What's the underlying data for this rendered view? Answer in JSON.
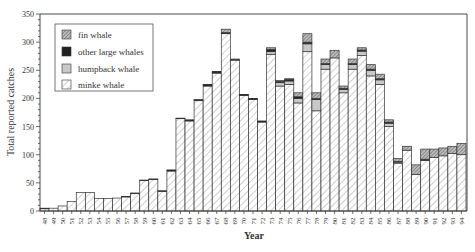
{
  "chart_data": {
    "type": "bar",
    "stacked": true,
    "title": "",
    "xlabel": "Year",
    "ylabel": "Total reported catches",
    "ylim": [
      0,
      350
    ],
    "yticks": [
      0,
      50,
      100,
      150,
      200,
      250,
      300,
      350
    ],
    "grid": false,
    "legend_position": "upper-left",
    "legend": [
      "fin whale",
      "other large whales",
      "humpback whale",
      "minke whale"
    ],
    "categories": [
      "48",
      "49",
      "50",
      "51",
      "52",
      "53",
      "54",
      "55",
      "56",
      "57",
      "58",
      "59",
      "60",
      "61",
      "62",
      "63",
      "64",
      "65",
      "66",
      "67",
      "68",
      "69",
      "70",
      "71",
      "72",
      "73",
      "74",
      "75",
      "76",
      "77",
      "78",
      "79",
      "80",
      "81",
      "82",
      "83",
      "84",
      "85",
      "86",
      "87",
      "88",
      "89",
      "90",
      "91",
      "92",
      "93",
      "94"
    ],
    "series": [
      {
        "name": "minke whale",
        "color": "#ffffff",
        "pattern": "light-hatch",
        "values": [
          4,
          5,
          9,
          17,
          33,
          33,
          22,
          22,
          23,
          25,
          31,
          54,
          56,
          35,
          71,
          164,
          160,
          196,
          222,
          245,
          315,
          268,
          205,
          198,
          158,
          278,
          222,
          225,
          192,
          283,
          178,
          252,
          272,
          210,
          252,
          276,
          240,
          225,
          150,
          85,
          108,
          65,
          90,
          95,
          98,
          102,
          100
        ]
      },
      {
        "name": "humpback whale",
        "color": "#c8c8c8",
        "pattern": "solid-gray",
        "values": [
          0,
          0,
          0,
          0,
          0,
          0,
          0,
          0,
          0,
          0,
          0,
          0,
          0,
          0,
          0,
          0,
          0,
          0,
          0,
          0,
          0,
          0,
          0,
          0,
          0,
          5,
          6,
          6,
          8,
          14,
          20,
          8,
          0,
          6,
          8,
          8,
          10,
          8,
          6,
          2,
          0,
          0,
          0,
          0,
          0,
          0,
          0
        ]
      },
      {
        "name": "other large whales",
        "color": "#222222",
        "pattern": "solid-black",
        "values": [
          1,
          0,
          0,
          0,
          0,
          0,
          0,
          0,
          0,
          1,
          1,
          1,
          1,
          1,
          2,
          1,
          2,
          2,
          2,
          2,
          2,
          1,
          1,
          1,
          2,
          4,
          2,
          3,
          3,
          3,
          2,
          2,
          0,
          2,
          2,
          2,
          2,
          2,
          2,
          1,
          0,
          0,
          2,
          0,
          0,
          0,
          0
        ]
      },
      {
        "name": "fin whale",
        "color": "#aaaaaa",
        "pattern": "dense-hatch",
        "values": [
          0,
          0,
          0,
          0,
          0,
          0,
          0,
          0,
          0,
          0,
          0,
          0,
          0,
          0,
          0,
          0,
          0,
          0,
          1,
          1,
          6,
          1,
          1,
          1,
          0,
          3,
          2,
          1,
          7,
          15,
          10,
          8,
          13,
          4,
          8,
          4,
          8,
          8,
          4,
          5,
          7,
          17,
          18,
          15,
          14,
          13,
          20
        ]
      }
    ]
  },
  "axes": {
    "x_title": "Year",
    "y_title": "Total reported catches"
  },
  "legend": {
    "items": [
      {
        "label": "fin whale",
        "swatch": "dense-hatch"
      },
      {
        "label": "other large whales",
        "swatch": "solid-black"
      },
      {
        "label": "humpback whale",
        "swatch": "solid-gray"
      },
      {
        "label": "minke whale",
        "swatch": "light-hatch"
      }
    ]
  }
}
